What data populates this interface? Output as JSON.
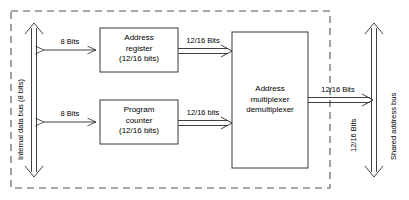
{
  "diagram": {
    "boundary": {
      "name": "microprocessor-chip-boundary",
      "style": "dashed"
    },
    "buses": {
      "internal": {
        "label_line1": "Internal data bus",
        "label_line2": "(8 bits)",
        "label_full": "Internal data bus  (8 bits)",
        "orientation": "vertical",
        "arrowheads": "both"
      },
      "shared": {
        "label": "Shared address bus",
        "width_label": "12/16 Bits",
        "orientation": "vertical",
        "arrowheads": "both"
      }
    },
    "blocks": [
      {
        "id": "address-register",
        "line1": "Address",
        "line2": "register",
        "line3": "(12/16 bits)"
      },
      {
        "id": "program-counter",
        "line1": "Program",
        "line2": "counter",
        "line3": "(12/16 bits)"
      },
      {
        "id": "address-multiplexer-demultiplexer",
        "line1": "Address",
        "line2": "multiplexer",
        "line3": "demultiplexer"
      }
    ],
    "connections": [
      {
        "id": "bus-to-address-register",
        "label": "8 Bits",
        "direction": "bidirectional"
      },
      {
        "id": "bus-to-program-counter",
        "label": "8 Bits",
        "direction": "bidirectional"
      },
      {
        "id": "address-register-to-mux",
        "label": "12/16 Bits",
        "direction": "right"
      },
      {
        "id": "program-counter-to-mux",
        "label": "12/16 bits",
        "direction": "right"
      },
      {
        "id": "mux-to-shared-bus",
        "label": "12/16 Bits",
        "direction": "right"
      }
    ]
  }
}
